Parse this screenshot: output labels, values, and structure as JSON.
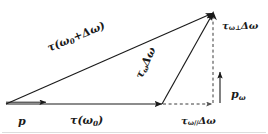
{
  "figure": {
    "background_color": "#ffffff",
    "stroke_color": "#1a1a1a",
    "width": 268,
    "height": 134
  },
  "labels": {
    "p": "p",
    "tau_omega0_pre": "τ(",
    "tau_omega0_sub": "ω",
    "tau_omega0_sub2": "0",
    "tau_omega0_post": ")",
    "tau_sum": "τ(ω",
    "tau_sum_sub": "0",
    "tau_sum_post": "+Δω)",
    "tau_domega": "τ",
    "tau_domega_sub": "ω",
    "tau_domega_post": "Δω",
    "tau_perp": "τ",
    "tau_perp_sub": "ω⊥",
    "tau_perp_post": "Δω",
    "tau_par": "τ",
    "tau_par_sub": "ω//",
    "tau_par_post": "Δω",
    "p_omega": "p",
    "p_omega_sub": "ω"
  },
  "vectors": [
    {
      "name": "p",
      "label": "p",
      "style": "solid",
      "from": [
        6,
        104
      ],
      "to": [
        46,
        104
      ],
      "description": "short horizontal arrow at origin labelled p"
    },
    {
      "name": "tau-omega0",
      "label": "τ(ω0)",
      "style": "solid",
      "from": [
        6,
        104
      ],
      "to": [
        162,
        104
      ],
      "description": "long horizontal arrow along the baseline"
    },
    {
      "name": "tau-omega0-plus-domega",
      "label": "τ(ω0+Δω)",
      "style": "solid",
      "from": [
        6,
        104
      ],
      "to": [
        213,
        13
      ],
      "description": "long diagonal hypotenuse arrow to apex"
    },
    {
      "name": "tau-omega-domega",
      "label": "τωΔω",
      "style": "solid",
      "from": [
        162,
        104
      ],
      "to": [
        213,
        13
      ],
      "description": "steep diagonal arrow from baseline tip to apex"
    },
    {
      "name": "p-omega",
      "label": "pω",
      "style": "solid",
      "from": [
        220,
        103
      ],
      "to": [
        220,
        69
      ],
      "description": "short vertical arrow labelled p omega"
    },
    {
      "name": "tau-omega-perp-domega",
      "label": "τω⊥Δω",
      "style": "dashed",
      "from": [
        213,
        104
      ],
      "to": [
        213,
        13
      ],
      "description": "vertical dashed perpendicular component"
    },
    {
      "name": "tau-omega-parallel-domega",
      "label": "τω//Δω",
      "style": "dashed",
      "from": [
        162,
        104
      ],
      "to": [
        213,
        104
      ],
      "description": "horizontal dashed parallel component"
    }
  ]
}
